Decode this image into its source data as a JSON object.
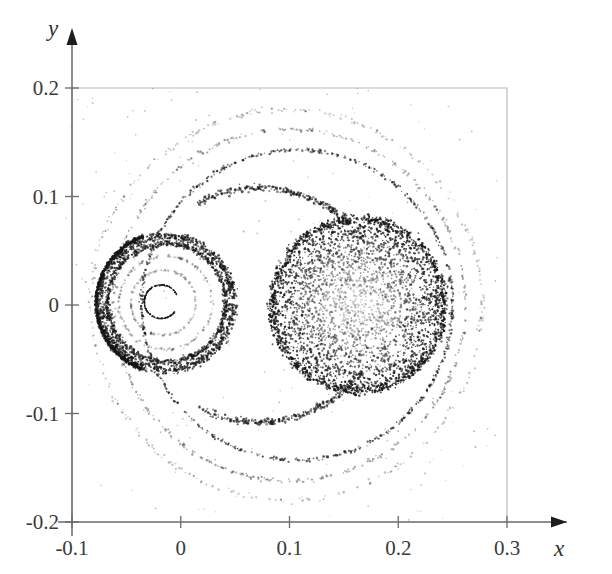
{
  "figure": {
    "kind": "poincare-surface-of-section",
    "background": "#ffffff",
    "point_color": "#171717",
    "frame_color": "#b9b9b9",
    "axis_color": "#6a6a6a"
  },
  "axes": {
    "x_name": "x",
    "y_name": "y",
    "x_ticks": [
      "-0.1",
      "0",
      "0.1",
      "0.2",
      "0.3"
    ],
    "y_ticks": [
      "0.2",
      "0.1",
      "0",
      "-0.1",
      "-0.2"
    ],
    "x_tick_values": [
      -0.1,
      0,
      0.1,
      0.2,
      0.3
    ],
    "y_tick_values": [
      0.2,
      0.1,
      0,
      -0.1,
      -0.2
    ],
    "x_arrow": true,
    "y_arrow": true
  },
  "chart_data": {
    "type": "scatter",
    "title": "",
    "xlabel": "x",
    "ylabel": "y",
    "xlim": [
      -0.115,
      0.315
    ],
    "ylim": [
      -0.215,
      0.225
    ],
    "grid": false,
    "legend": null,
    "marker": {
      "shape": "dot",
      "size": 1.3,
      "color": "#171717"
    },
    "axis_frame": {
      "left": -0.1,
      "right": 0.3,
      "bottom": -0.2,
      "top": 0.2
    },
    "features": [
      {
        "name": "inner-invariant-curve",
        "type": "open-circle",
        "cx": -0.018,
        "cy": 0.003,
        "r": 0.0155,
        "gap_deg": [
          -35,
          25
        ],
        "n": 260
      },
      {
        "name": "left-island-faint-ring-1",
        "type": "ring",
        "cx": -0.016,
        "cy": 0.002,
        "r": 0.03,
        "spread": 0.0012,
        "n": 150,
        "opacity": 0.3
      },
      {
        "name": "left-island-faint-ring-2",
        "type": "ring",
        "cx": -0.014,
        "cy": 0.002,
        "r": 0.043,
        "spread": 0.0014,
        "n": 170,
        "opacity": 0.34
      },
      {
        "name": "left-chaotic-annulus-inner",
        "type": "ring",
        "cx": -0.013,
        "cy": 0.002,
        "r": 0.0545,
        "spread": 0.003,
        "n": 900,
        "opacity": 0.85
      },
      {
        "name": "left-chaotic-annulus-outer",
        "type": "ring",
        "cx": -0.013,
        "cy": 0.002,
        "r": 0.0615,
        "spread": 0.0045,
        "n": 1150,
        "opacity": 0.9
      },
      {
        "name": "left-separatrix-arc",
        "type": "arc",
        "cx": -0.012,
        "cy": 0.002,
        "r": 0.0655,
        "spread": 0.0016,
        "n": 700,
        "a0": 110,
        "a1": 250,
        "opacity": 0.95
      },
      {
        "name": "right-chaotic-disk",
        "type": "disk",
        "cx": 0.163,
        "cy": 0.0,
        "r": 0.082,
        "n": 3000,
        "edge_bias": 2.1
      },
      {
        "name": "right-disk-rim",
        "type": "ring",
        "cx": 0.163,
        "cy": 0.0,
        "r": 0.079,
        "spread": 0.005,
        "n": 900,
        "opacity": 0.9
      },
      {
        "name": "outer-curve-inner",
        "type": "ring",
        "cx": 0.107,
        "cy": 0.0,
        "r": 0.143,
        "spread": 0.0018,
        "n": 620,
        "opacity": 0.8,
        "squash": 1.0
      },
      {
        "name": "outer-curve-middle",
        "type": "ring",
        "cx": 0.1,
        "cy": 0.0,
        "r": 0.162,
        "spread": 0.0022,
        "n": 430,
        "opacity": 0.45
      },
      {
        "name": "outer-curve-outer",
        "type": "ring",
        "cx": 0.097,
        "cy": 0.0,
        "r": 0.18,
        "spread": 0.0026,
        "n": 330,
        "opacity": 0.32
      },
      {
        "name": "bridge-upper",
        "type": "arc",
        "cx": 0.072,
        "cy": -0.012,
        "r": 0.12,
        "spread": 0.0035,
        "n": 260,
        "a0": 38,
        "a1": 118,
        "opacity": 0.8
      },
      {
        "name": "bridge-lower",
        "type": "arc",
        "cx": 0.072,
        "cy": 0.012,
        "r": 0.12,
        "spread": 0.0035,
        "n": 260,
        "a0": -118,
        "a1": -38,
        "opacity": 0.8
      },
      {
        "name": "background-sparse",
        "type": "sparse",
        "n": 210,
        "opacity": 0.35
      }
    ]
  }
}
